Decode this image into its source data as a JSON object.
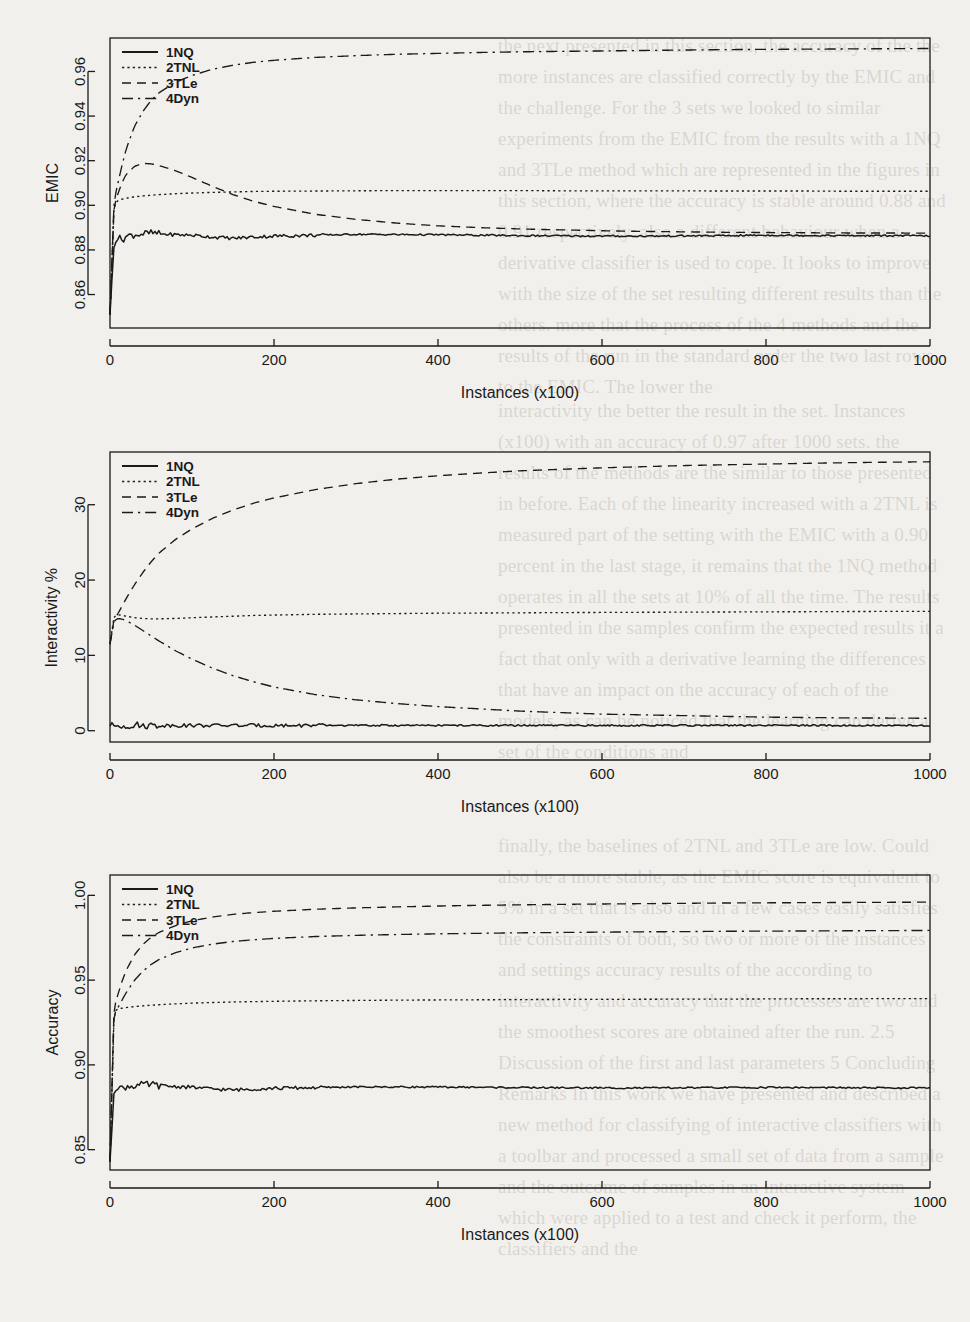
{
  "figure": {
    "background_color": "#f2f0ec",
    "ink_color": "#1a1a1a",
    "panel_count": 3
  },
  "legend_common": {
    "items": [
      {
        "label": "1NQ",
        "style": "solid"
      },
      {
        "label": "2TNL",
        "style": "dotted"
      },
      {
        "label": "3TLe",
        "style": "dashed"
      },
      {
        "label": "4Dyn",
        "style": "dashdot"
      }
    ]
  },
  "background_text": {
    "lines": [
      "the next presented in this section, the accuracy of the",
      "the more instances are classified correctly by the EMIC and the",
      "challenge. For the 3 sets we looked to similar experiments",
      "from the EMIC from the results with a 1NQ and 3TLe method",
      "which are represented in the figures in this section, where the",
      "accuracy is stable around 0.88 and 0.91 respectively.",
      "also a different behaviour when a derivative classifier is used",
      "to cope. It looks to improve with the size of the set resulting",
      "different results than the others.",
      "more that the process of the 4 methods and the results of the run",
      "in the standard order the two last rows, to the EMIC. The lower the",
      "interactivity the better the result in the set.",
      "Instances (x100) with an accuracy of 0.97 after 1000 sets.",
      "the results of the methods are the similar to those presented in",
      "before. Each of the linearity increased with a 2TNL is measured",
      "part of the setting with the EMIC with a 0.90 percent in the last",
      "stage, it remains that the 1NQ method operates in all the sets at",
      "10% of all the time.",
      "The results presented in the samples confirm the expected results",
      "it a fact that only with a derivative learning the differences that",
      "have an impact on the accuracy of each of the models, as can be",
      "noticed that the learning can derive a set of the conditions and",
      "finally, the baselines of 2TNL and 3TLe are low. Could also be a more",
      "stable, as the EMIC score is equivalent to 5% in a set that is also",
      "and in a few cases easily satisfies the constraints of both, so two or",
      "more of the instances and settings accuracy results of the",
      "according to interactivity and accuracy that the processes are two",
      "and the smoothest scores are obtained after the run.",
      "2.5 Discussion of the first and last parameters",
      "5    Concluding Remarks",
      "In this work we have presented and described a new method for classifying",
      "of interactive classifiers with a toolbar and processed a small set of",
      "data from a sample and the outcome of samples in an interactive system",
      "which were applied to a test and check it perform, the classifiers and the",
      "results from our interactivity."
    ]
  },
  "chart_data": [
    {
      "id": "emic",
      "type": "line",
      "title": "",
      "xlabel": "Instances (x100)",
      "ylabel": "EMIC",
      "xlim": [
        0,
        1000
      ],
      "ylim": [
        0.845,
        0.975
      ],
      "xticks": [
        0,
        200,
        400,
        600,
        800,
        1000
      ],
      "yticks": [
        0.86,
        0.88,
        0.9,
        0.92,
        0.94,
        0.96
      ],
      "ytick_labels": [
        "0.86",
        "0.88",
        "0.90",
        "0.92",
        "0.94",
        "0.96"
      ],
      "grid": false,
      "legend_position": "top-left",
      "x": [
        0,
        5,
        10,
        15,
        20,
        30,
        40,
        50,
        60,
        80,
        100,
        125,
        150,
        175,
        200,
        250,
        300,
        350,
        400,
        450,
        500,
        550,
        600,
        650,
        700,
        750,
        800,
        850,
        900,
        950,
        1000
      ],
      "series": [
        {
          "name": "1NQ",
          "style": "solid",
          "values": [
            0.851,
            0.884,
            0.8855,
            0.8845,
            0.8862,
            0.8868,
            0.8872,
            0.8876,
            0.8872,
            0.8868,
            0.8866,
            0.8858,
            0.8852,
            0.8858,
            0.8862,
            0.8866,
            0.887,
            0.8869,
            0.8868,
            0.8866,
            0.8864,
            0.8863,
            0.8862,
            0.8862,
            0.8863,
            0.8864,
            0.8866,
            0.8865,
            0.8864,
            0.8864,
            0.8863
          ]
        },
        {
          "name": "2TNL",
          "style": "dotted",
          "values": [
            0.851,
            0.9005,
            0.9022,
            0.9028,
            0.9032,
            0.9038,
            0.9042,
            0.9045,
            0.9048,
            0.9052,
            0.9055,
            0.9058,
            0.906,
            0.9062,
            0.9063,
            0.9064,
            0.9065,
            0.9066,
            0.9066,
            0.9066,
            0.9066,
            0.9065,
            0.9065,
            0.9065,
            0.9065,
            0.9064,
            0.9064,
            0.9064,
            0.9063,
            0.9063,
            0.9063
          ]
        },
        {
          "name": "3TLe",
          "style": "dashed",
          "values": [
            0.851,
            0.9,
            0.9055,
            0.9105,
            0.914,
            0.9175,
            0.9188,
            0.9186,
            0.9178,
            0.9155,
            0.9125,
            0.9085,
            0.9048,
            0.9018,
            0.8995,
            0.896,
            0.8937,
            0.892,
            0.8908,
            0.89,
            0.8894,
            0.889,
            0.8886,
            0.8883,
            0.8881,
            0.8879,
            0.8878,
            0.8877,
            0.8876,
            0.8876,
            0.8875
          ]
        },
        {
          "name": "4Dyn",
          "style": "dashdot",
          "values": [
            0.851,
            0.902,
            0.9105,
            0.9185,
            0.9255,
            0.9355,
            0.942,
            0.947,
            0.9505,
            0.9552,
            0.9582,
            0.961,
            0.9628,
            0.9641,
            0.965,
            0.9663,
            0.9671,
            0.9677,
            0.9681,
            0.9685,
            0.9688,
            0.969,
            0.9692,
            0.9694,
            0.9696,
            0.9698,
            0.9699,
            0.97,
            0.9701,
            0.9702,
            0.9703
          ]
        }
      ]
    },
    {
      "id": "interactivity",
      "type": "line",
      "title": "",
      "xlabel": "Instances (x100)",
      "ylabel": "Interactivity %",
      "xlim": [
        0,
        1000
      ],
      "ylim": [
        -1.5,
        37
      ],
      "xticks": [
        0,
        200,
        400,
        600,
        800,
        1000
      ],
      "yticks": [
        0,
        10,
        20,
        30
      ],
      "ytick_labels": [
        "0",
        "10",
        "20",
        "30"
      ],
      "grid": false,
      "legend_position": "top-left",
      "x": [
        0,
        5,
        10,
        15,
        20,
        30,
        40,
        50,
        60,
        80,
        100,
        125,
        150,
        175,
        200,
        250,
        300,
        350,
        400,
        450,
        500,
        550,
        600,
        650,
        700,
        750,
        800,
        850,
        900,
        950,
        1000
      ],
      "series": [
        {
          "name": "1NQ",
          "style": "solid",
          "values": [
            0.6,
            0.7,
            0.7,
            0.7,
            0.7,
            0.7,
            0.7,
            0.7,
            0.7,
            0.7,
            0.7,
            0.7,
            0.7,
            0.7,
            0.7,
            0.7,
            0.7,
            0.7,
            0.7,
            0.7,
            0.7,
            0.7,
            0.7,
            0.7,
            0.7,
            0.7,
            0.7,
            0.7,
            0.7,
            0.7,
            0.7
          ]
        },
        {
          "name": "2TNL",
          "style": "dotted",
          "values": [
            11.5,
            15.2,
            15.4,
            15.3,
            15.2,
            15.0,
            14.9,
            14.85,
            14.85,
            14.9,
            15.0,
            15.1,
            15.2,
            15.3,
            15.35,
            15.45,
            15.5,
            15.55,
            15.6,
            15.62,
            15.65,
            15.68,
            15.7,
            15.72,
            15.74,
            15.76,
            15.78,
            15.8,
            15.82,
            15.84,
            15.85
          ]
        },
        {
          "name": "3TLe",
          "style": "dashed",
          "values": [
            11.5,
            14.8,
            15.6,
            16.6,
            17.6,
            19.4,
            21.0,
            22.4,
            23.6,
            25.4,
            26.8,
            28.2,
            29.3,
            30.2,
            30.9,
            32.0,
            32.8,
            33.4,
            33.85,
            34.2,
            34.5,
            34.7,
            34.9,
            35.05,
            35.2,
            35.3,
            35.4,
            35.5,
            35.58,
            35.65,
            35.7
          ]
        },
        {
          "name": "4Dyn",
          "style": "dashdot",
          "values": [
            11.5,
            14.6,
            14.9,
            14.8,
            14.6,
            14.0,
            13.3,
            12.6,
            11.9,
            10.6,
            9.5,
            8.3,
            7.3,
            6.5,
            5.8,
            4.8,
            4.1,
            3.6,
            3.2,
            2.9,
            2.6,
            2.4,
            2.2,
            2.1,
            2.0,
            1.9,
            1.8,
            1.75,
            1.7,
            1.68,
            1.65
          ]
        }
      ]
    },
    {
      "id": "accuracy",
      "type": "line",
      "title": "",
      "xlabel": "Instances (x100)",
      "ylabel": "Accuracy",
      "xlim": [
        0,
        1000
      ],
      "ylim": [
        0.838,
        1.012
      ],
      "xticks": [
        0,
        200,
        400,
        600,
        800,
        1000
      ],
      "yticks": [
        0.85,
        0.9,
        0.95,
        1.0
      ],
      "ytick_labels": [
        "0.85",
        "0.90",
        "0.95",
        "1.00"
      ],
      "grid": false,
      "legend_position": "top-left",
      "x": [
        0,
        5,
        10,
        15,
        20,
        30,
        40,
        50,
        60,
        80,
        100,
        125,
        150,
        175,
        200,
        250,
        300,
        350,
        400,
        450,
        500,
        550,
        600,
        650,
        700,
        750,
        800,
        850,
        900,
        950,
        1000
      ],
      "series": [
        {
          "name": "1NQ",
          "style": "solid",
          "values": [
            0.843,
            0.8862,
            0.8875,
            0.8858,
            0.8872,
            0.8878,
            0.8882,
            0.8884,
            0.8878,
            0.8872,
            0.8868,
            0.8858,
            0.8852,
            0.8858,
            0.8862,
            0.8866,
            0.887,
            0.887,
            0.8869,
            0.8868,
            0.8866,
            0.8865,
            0.8864,
            0.8864,
            0.8865,
            0.8866,
            0.8867,
            0.8866,
            0.8865,
            0.8864,
            0.8864
          ]
        },
        {
          "name": "2TNL",
          "style": "dotted",
          "values": [
            0.843,
            0.9315,
            0.933,
            0.9335,
            0.9338,
            0.9344,
            0.9348,
            0.9352,
            0.9355,
            0.936,
            0.9364,
            0.9368,
            0.9371,
            0.9373,
            0.9375,
            0.9378,
            0.938,
            0.9382,
            0.9383,
            0.9384,
            0.9385,
            0.9386,
            0.9386,
            0.9387,
            0.9388,
            0.9388,
            0.9389,
            0.939,
            0.939,
            0.9391,
            0.9391
          ]
        },
        {
          "name": "3TLe",
          "style": "dashed",
          "values": [
            0.843,
            0.9345,
            0.942,
            0.9498,
            0.956,
            0.965,
            0.971,
            0.9752,
            0.9782,
            0.9822,
            0.985,
            0.9872,
            0.9888,
            0.9898,
            0.9906,
            0.9918,
            0.9926,
            0.9932,
            0.9937,
            0.9941,
            0.9944,
            0.9947,
            0.9949,
            0.9951,
            0.9953,
            0.9955,
            0.9956,
            0.9957,
            0.9958,
            0.9959,
            0.996
          ]
        },
        {
          "name": "4Dyn",
          "style": "dashdot",
          "values": [
            0.843,
            0.931,
            0.934,
            0.9385,
            0.9428,
            0.95,
            0.9552,
            0.9592,
            0.9622,
            0.9662,
            0.969,
            0.9712,
            0.9728,
            0.9738,
            0.9746,
            0.9757,
            0.9764,
            0.9769,
            0.9773,
            0.9776,
            0.9779,
            0.9781,
            0.9783,
            0.9785,
            0.9786,
            0.9788,
            0.9789,
            0.979,
            0.9791,
            0.9792,
            0.9793
          ]
        }
      ]
    }
  ]
}
